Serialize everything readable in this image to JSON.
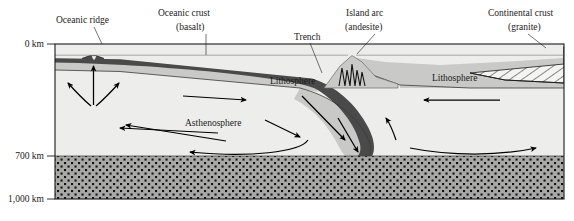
{
  "figure": {
    "background_color": "#ffffff"
  },
  "axis": {
    "ticks": [
      {
        "label": "0 km",
        "depth_km": 0
      },
      {
        "label": "700 km",
        "depth_km": 700
      },
      {
        "label": "1,000 km",
        "depth_km": 1000
      }
    ]
  },
  "callouts": [
    {
      "id": "oceanic-ridge",
      "label": "Oceanic ridge",
      "label2": ""
    },
    {
      "id": "oceanic-crust",
      "label": "Oceanic crust",
      "label2": "(basalt)"
    },
    {
      "id": "trench",
      "label": "Trench",
      "label2": ""
    },
    {
      "id": "island-arc",
      "label": "Island arc",
      "label2": "(andesite)"
    },
    {
      "id": "continental-crust",
      "label": "Continental crust",
      "label2": "(granite)"
    }
  ],
  "layers": [
    {
      "id": "lithosphere-left",
      "label": "Lithosphere"
    },
    {
      "id": "lithosphere-right",
      "label": "Lithosphere"
    },
    {
      "id": "asthenosphere",
      "label": "Asthenosphere"
    },
    {
      "id": "lower-mantle",
      "label": ""
    }
  ],
  "colors": {
    "sea": "#ececeb",
    "lithosphere": "#c9c9c7",
    "asthenosphere": "#ededec",
    "lower_mantle": "#a8a8a6",
    "crust_dark": "#4a4a4a",
    "outline": "#1a1a1a",
    "hatch": "#1a1a1a",
    "label_text": "#1a1a1a"
  }
}
